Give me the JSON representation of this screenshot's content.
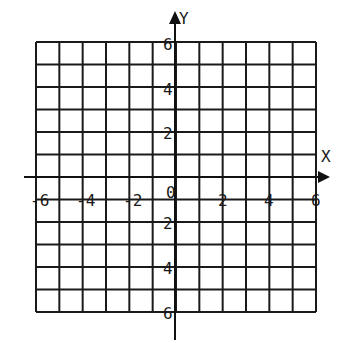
{
  "chart_data": {
    "type": "grid",
    "title": "",
    "xlabel": "X",
    "ylabel": "Y",
    "xlim": [
      -6,
      6
    ],
    "ylim": [
      -6,
      6
    ],
    "grid": true,
    "grid_step": 1,
    "x_tick_labels": [
      "-6",
      "-4",
      "-2",
      "0",
      "2",
      "4",
      "6"
    ],
    "x_tick_values": [
      -6,
      -4,
      -2,
      0,
      2,
      4,
      6
    ],
    "y_tick_labels_positive": [
      "6",
      "4",
      "2"
    ],
    "y_tick_labels_negative": [
      "2",
      "4",
      "6"
    ],
    "y_tick_values": [
      6,
      4,
      2,
      -2,
      -4,
      -6
    ]
  },
  "axes": {
    "x_label": "X",
    "y_label": "Y"
  },
  "colors": {
    "line": "#1a1a1a",
    "background": "#ffffff"
  }
}
